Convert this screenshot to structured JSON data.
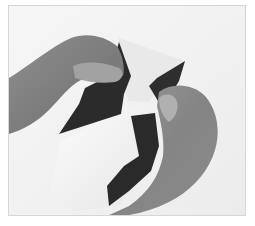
{
  "image": {
    "description": "Grayscale photograph of two hands folding a two-tone (dark/white) origami paper",
    "colors": {
      "background": "#f4f4f4",
      "frame_border": "#d6d6d6",
      "paper_dark": "#2b2b2b",
      "paper_light": "#f7f7f7",
      "skin": "#8a8a8a",
      "skin_shadow": "#6e6e6e",
      "skin_highlight": "#a4a4a4"
    },
    "caption": ""
  }
}
